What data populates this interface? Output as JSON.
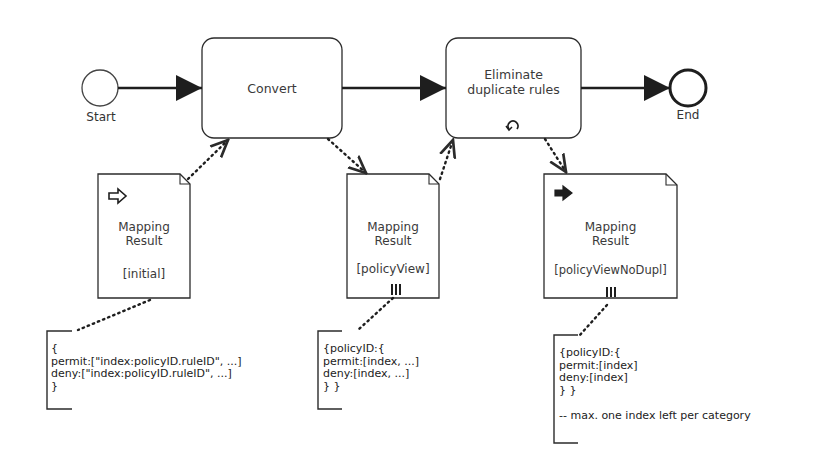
{
  "events": {
    "start": {
      "label": "Start"
    },
    "end": {
      "label": "End"
    }
  },
  "tasks": [
    {
      "id": "convert",
      "label": "Convert",
      "marker": "none"
    },
    {
      "id": "eliminate",
      "label": "Eliminate duplicate rules",
      "label_lines": [
        "Eliminate",
        "duplicate rules"
      ],
      "marker": "loop-icon"
    }
  ],
  "data_objects": [
    {
      "label_lines": [
        "Mapping",
        "Result"
      ],
      "state": "[initial]",
      "marker": "input-arrow-icon",
      "collection": false
    },
    {
      "label_lines": [
        "Mapping",
        "Result"
      ],
      "state": "[policyView]",
      "marker": "none",
      "collection": true
    },
    {
      "label_lines": [
        "Mapping",
        "Result"
      ],
      "state": "[policyViewNoDupl]",
      "marker": "output-arrow-icon",
      "collection": true
    }
  ],
  "annotations": [
    {
      "text": "{\npermit:[\"index:policyID.ruleID\", ...]\ndeny:[\"index:policyID.ruleID\", ...]\n}"
    },
    {
      "text": "{policyID:{\npermit:[index, ...]\ndeny:[index, ...]\n} }"
    },
    {
      "text": "{policyID:{\npermit:[index]\ndeny:[index]\n} }\n\n-- max. one index left per category"
    }
  ],
  "colors": {
    "stroke": "#2b2b2b",
    "text": "#3a3a3a",
    "background": "#ffffff"
  }
}
